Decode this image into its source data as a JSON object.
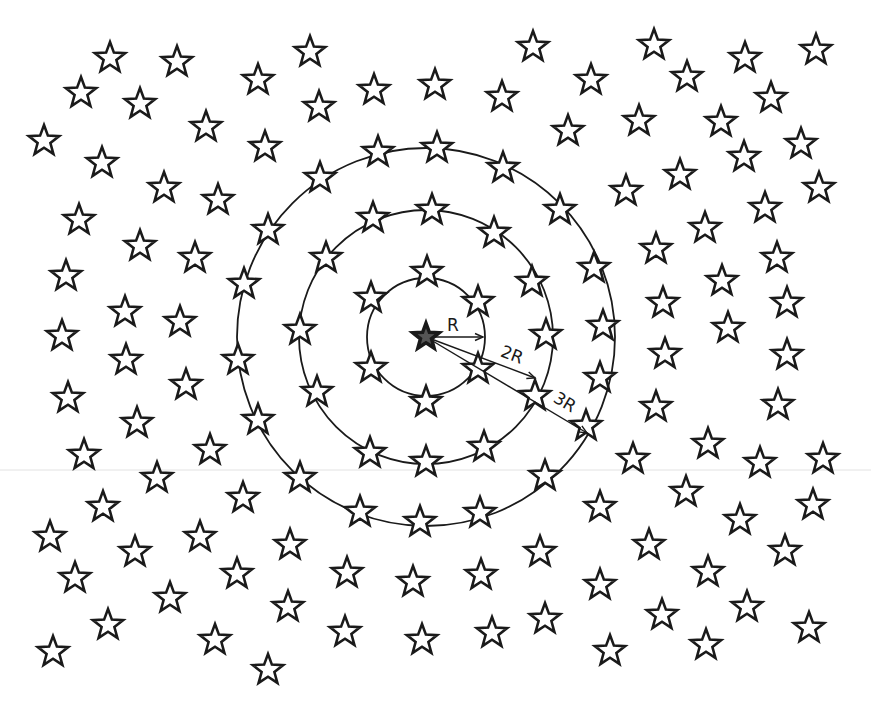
{
  "diagram": {
    "title": "",
    "center": {
      "x": 426,
      "y": 337
    },
    "star_size": 16,
    "rings": [
      {
        "name": "ring-R",
        "radius": 59
      },
      {
        "name": "ring-2R",
        "radius": 127
      },
      {
        "name": "ring-3R",
        "radius": 189
      }
    ],
    "radius_markers": [
      {
        "label": "R",
        "to": {
          "x": 483,
          "y": 337
        },
        "label_pos": {
          "x": 453,
          "y": 331
        },
        "angle": 0
      },
      {
        "label": "2R",
        "to": {
          "x": 535,
          "y": 378
        },
        "label_pos": {
          "x": 510,
          "y": 360
        },
        "angle": 21
      },
      {
        "label": "3R",
        "to": {
          "x": 587,
          "y": 433
        },
        "label_pos": {
          "x": 562,
          "y": 407
        },
        "angle": 31
      }
    ],
    "center_star": {
      "x": 426,
      "y": 337,
      "filled": true
    },
    "stars": [
      [
        110,
        58
      ],
      [
        177,
        62
      ],
      [
        310,
        52
      ],
      [
        533,
        47
      ],
      [
        654,
        45
      ],
      [
        745,
        58
      ],
      [
        816,
        50
      ],
      [
        81,
        93
      ],
      [
        140,
        104
      ],
      [
        258,
        80
      ],
      [
        319,
        107
      ],
      [
        374,
        90
      ],
      [
        435,
        85
      ],
      [
        502,
        97
      ],
      [
        591,
        80
      ],
      [
        687,
        77
      ],
      [
        44,
        141
      ],
      [
        206,
        127
      ],
      [
        265,
        147
      ],
      [
        568,
        131
      ],
      [
        639,
        121
      ],
      [
        721,
        122
      ],
      [
        771,
        98
      ],
      [
        102,
        163
      ],
      [
        164,
        188
      ],
      [
        218,
        200
      ],
      [
        378,
        152
      ],
      [
        437,
        148
      ],
      [
        503,
        168
      ],
      [
        626,
        191
      ],
      [
        680,
        175
      ],
      [
        744,
        157
      ],
      [
        801,
        144
      ],
      [
        819,
        188
      ],
      [
        79,
        220
      ],
      [
        320,
        178
      ],
      [
        560,
        210
      ],
      [
        765,
        208
      ],
      [
        140,
        246
      ],
      [
        195,
        258
      ],
      [
        268,
        230
      ],
      [
        373,
        218
      ],
      [
        432,
        210
      ],
      [
        494,
        233
      ],
      [
        656,
        249
      ],
      [
        705,
        228
      ],
      [
        777,
        258
      ],
      [
        66,
        276
      ],
      [
        326,
        258
      ],
      [
        427,
        272
      ],
      [
        532,
        282
      ],
      [
        594,
        268
      ],
      [
        244,
        284
      ],
      [
        722,
        281
      ],
      [
        663,
        303
      ],
      [
        787,
        303
      ],
      [
        125,
        312
      ],
      [
        180,
        322
      ],
      [
        371,
        298
      ],
      [
        478,
        302
      ],
      [
        603,
        326
      ],
      [
        728,
        328
      ],
      [
        62,
        336
      ],
      [
        300,
        330
      ],
      [
        546,
        335
      ],
      [
        126,
        360
      ],
      [
        238,
        360
      ],
      [
        665,
        354
      ],
      [
        787,
        355
      ],
      [
        371,
        368
      ],
      [
        478,
        369
      ],
      [
        317,
        392
      ],
      [
        535,
        396
      ],
      [
        600,
        378
      ],
      [
        186,
        385
      ],
      [
        68,
        398
      ],
      [
        426,
        402
      ],
      [
        137,
        423
      ],
      [
        258,
        420
      ],
      [
        656,
        407
      ],
      [
        778,
        405
      ],
      [
        586,
        426
      ],
      [
        84,
        455
      ],
      [
        210,
        450
      ],
      [
        370,
        453
      ],
      [
        484,
        447
      ],
      [
        426,
        462
      ],
      [
        633,
        459
      ],
      [
        708,
        444
      ],
      [
        760,
        463
      ],
      [
        823,
        459
      ],
      [
        300,
        478
      ],
      [
        545,
        476
      ],
      [
        157,
        478
      ],
      [
        103,
        507
      ],
      [
        243,
        498
      ],
      [
        600,
        507
      ],
      [
        686,
        492
      ],
      [
        813,
        505
      ],
      [
        740,
        520
      ],
      [
        360,
        512
      ],
      [
        420,
        522
      ],
      [
        480,
        513
      ],
      [
        50,
        537
      ],
      [
        135,
        552
      ],
      [
        200,
        537
      ],
      [
        290,
        545
      ],
      [
        540,
        552
      ],
      [
        649,
        545
      ],
      [
        785,
        551
      ],
      [
        75,
        578
      ],
      [
        237,
        574
      ],
      [
        347,
        573
      ],
      [
        413,
        582
      ],
      [
        481,
        575
      ],
      [
        600,
        585
      ],
      [
        708,
        572
      ],
      [
        170,
        598
      ],
      [
        288,
        607
      ],
      [
        747,
        607
      ],
      [
        108,
        625
      ],
      [
        215,
        640
      ],
      [
        345,
        632
      ],
      [
        422,
        640
      ],
      [
        492,
        633
      ],
      [
        545,
        619
      ],
      [
        662,
        615
      ],
      [
        809,
        628
      ],
      [
        53,
        652
      ],
      [
        268,
        670
      ],
      [
        610,
        651
      ],
      [
        706,
        645
      ]
    ],
    "colors": {
      "ink": "#1a1a1a",
      "background": "#ffffff"
    }
  }
}
